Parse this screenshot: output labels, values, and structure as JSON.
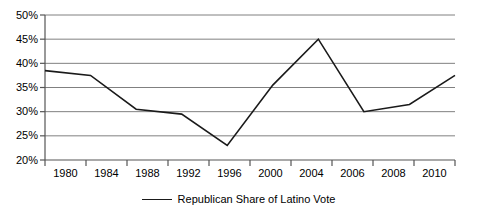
{
  "chart_data": {
    "type": "line",
    "title": "",
    "xlabel": "",
    "ylabel": "",
    "categories": [
      "1980",
      "1984",
      "1988",
      "1992",
      "1996",
      "2000",
      "2004",
      "2006",
      "2008",
      "2010"
    ],
    "values": [
      38.5,
      37.5,
      30.5,
      29.5,
      23.0,
      35.5,
      45.0,
      30.0,
      31.5,
      37.5
    ],
    "series": [
      {
        "name": "Republican Share of Latino Vote",
        "values": [
          38.5,
          37.5,
          30.5,
          29.5,
          23.0,
          35.5,
          45.0,
          30.0,
          31.5,
          37.5
        ],
        "color": "#1a1a1a"
      }
    ],
    "ylim": [
      20,
      50
    ],
    "ytick_values": [
      50,
      45,
      40,
      35,
      30,
      25,
      20
    ],
    "ytick_labels": [
      "50%",
      "45%",
      "40%",
      "35%",
      "30%",
      "25%",
      "20%"
    ],
    "grid": true,
    "grid_axis": "y",
    "grid_color": "#808080",
    "legend_position": "bottom"
  },
  "legend": {
    "label": "Republican Share of Latino Vote"
  },
  "axis": {
    "y_labels": [
      "50%",
      "45%",
      "40%",
      "35%",
      "30%",
      "25%",
      "20%"
    ],
    "x_labels": [
      "1980",
      "1984",
      "1988",
      "1992",
      "1996",
      "2000",
      "2004",
      "2006",
      "2008",
      "2010"
    ]
  }
}
